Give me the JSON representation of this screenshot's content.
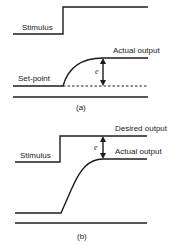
{
  "panel_a": {
    "caption": "(a)",
    "stimulus_label": "Stimulus",
    "actual_output_label": "Actual output",
    "set_point_label": "Set-point",
    "error_label": "e"
  },
  "panel_b": {
    "caption": "(b)",
    "stimulus_label": "Stimulus",
    "desired_output_label": "Desired output",
    "actual_output_label": "Actual output",
    "error_label": "e"
  },
  "colors": {
    "ink": "#1c1c1c",
    "background": "#ffffff"
  }
}
